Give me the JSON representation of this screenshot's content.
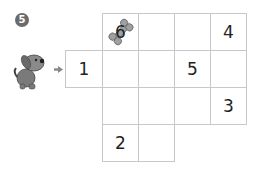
{
  "puzzle": {
    "number_badge": "5",
    "start_arrow": "arrow-right-icon",
    "character": "dog-icon",
    "grid": {
      "cell_size": 37,
      "cells": [
        {
          "row": 0,
          "col": 1,
          "value": "6",
          "icon": "bone-icon"
        },
        {
          "row": 0,
          "col": 2,
          "value": ""
        },
        {
          "row": 0,
          "col": 3,
          "value": ""
        },
        {
          "row": 0,
          "col": 4,
          "value": "4"
        },
        {
          "row": 1,
          "col": 0,
          "value": "1"
        },
        {
          "row": 1,
          "col": 1,
          "value": ""
        },
        {
          "row": 1,
          "col": 2,
          "value": ""
        },
        {
          "row": 1,
          "col": 3,
          "value": "5"
        },
        {
          "row": 1,
          "col": 4,
          "value": ""
        },
        {
          "row": 2,
          "col": 1,
          "value": ""
        },
        {
          "row": 2,
          "col": 2,
          "value": ""
        },
        {
          "row": 2,
          "col": 3,
          "value": ""
        },
        {
          "row": 2,
          "col": 4,
          "value": "3"
        },
        {
          "row": 3,
          "col": 1,
          "value": "2"
        },
        {
          "row": 3,
          "col": 2,
          "value": ""
        }
      ]
    },
    "colors": {
      "grid_line": "#c8c8c8",
      "text": "#222222",
      "dog": "#7a7a7a",
      "bone": "#9a9a9a"
    }
  }
}
